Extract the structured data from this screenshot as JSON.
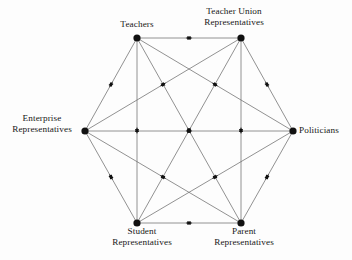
{
  "diagram": {
    "type": "network-diagram",
    "background_color": "#fdfdfd",
    "edge_color": "#6e6e6e",
    "node_color": "#111111",
    "label_color": "#171717",
    "node_radius": 3.6,
    "nodes": [
      {
        "id": "teachers",
        "label_lines": [
          "Teachers"
        ],
        "x": 137,
        "y": 38
      },
      {
        "id": "union",
        "label_lines": [
          "Teacher Union",
          "Representatives"
        ],
        "x": 241,
        "y": 38
      },
      {
        "id": "politicians",
        "label_lines": [
          "Politicians"
        ],
        "x": 293,
        "y": 131
      },
      {
        "id": "parent",
        "label_lines": [
          "Parent",
          "Representatives"
        ],
        "x": 241,
        "y": 223
      },
      {
        "id": "student",
        "label_lines": [
          "Student",
          "Representatives"
        ],
        "x": 137,
        "y": 223
      },
      {
        "id": "enterprise",
        "label_lines": [
          "Enterprise",
          "Representatives"
        ],
        "x": 85,
        "y": 131
      }
    ],
    "edges": [
      {
        "from": "teachers",
        "to": "union",
        "bidirectional": true
      },
      {
        "from": "teachers",
        "to": "politicians",
        "bidirectional": true
      },
      {
        "from": "teachers",
        "to": "parent",
        "bidirectional": true
      },
      {
        "from": "teachers",
        "to": "student",
        "bidirectional": true
      },
      {
        "from": "teachers",
        "to": "enterprise",
        "bidirectional": true
      },
      {
        "from": "union",
        "to": "politicians",
        "bidirectional": true
      },
      {
        "from": "union",
        "to": "parent",
        "bidirectional": true
      },
      {
        "from": "union",
        "to": "student",
        "bidirectional": true
      },
      {
        "from": "union",
        "to": "enterprise",
        "bidirectional": true
      },
      {
        "from": "politicians",
        "to": "parent",
        "bidirectional": true
      },
      {
        "from": "politicians",
        "to": "student",
        "bidirectional": true
      },
      {
        "from": "politicians",
        "to": "enterprise",
        "bidirectional": true
      },
      {
        "from": "parent",
        "to": "student",
        "bidirectional": true
      },
      {
        "from": "parent",
        "to": "enterprise",
        "bidirectional": true
      },
      {
        "from": "student",
        "to": "enterprise",
        "bidirectional": true
      }
    ]
  },
  "labels": {
    "teachers": {
      "line1": "Teachers"
    },
    "union": {
      "line1": "Teacher Union",
      "line2": "Representatives"
    },
    "politicians": {
      "line1": "Politicians"
    },
    "parent": {
      "line1": "Parent",
      "line2": "Representatives"
    },
    "student": {
      "line1": "Student",
      "line2": "Representatives"
    },
    "enterprise": {
      "line1": "Enterprise",
      "line2": "Representatives"
    }
  }
}
